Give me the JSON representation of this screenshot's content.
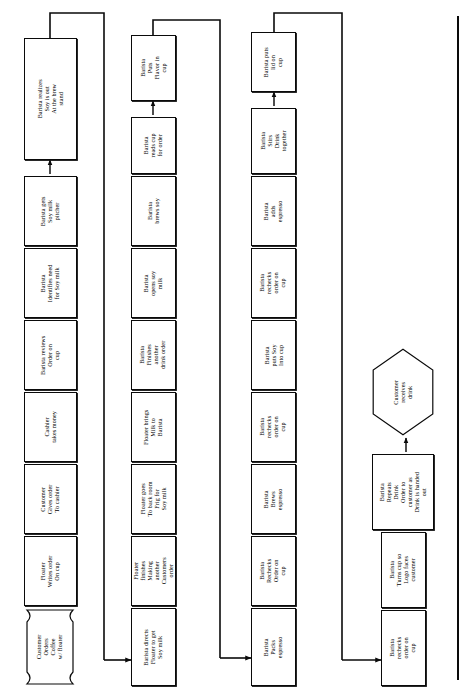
{
  "diagram": {
    "orientation": "rotated-90-ccw",
    "line_color": "#0a0a0a",
    "fill_color": "#ffffff",
    "rows": [
      {
        "id": "row-1",
        "nodes": [
          {
            "id": "n1",
            "shape": "banner",
            "lines": [
              "Customer",
              "Orders",
              "Coffee",
              "w/ floater"
            ]
          },
          {
            "id": "n2",
            "shape": "rect",
            "lines": [
              "Floater",
              "Writes order",
              "On cup"
            ]
          },
          {
            "id": "n3",
            "shape": "rect",
            "lines": [
              "Customer",
              "Gives order",
              "To cashier"
            ]
          },
          {
            "id": "n4",
            "shape": "rect",
            "lines": [
              "Cashier",
              "takes money"
            ]
          },
          {
            "id": "n5",
            "shape": "rect",
            "lines": [
              "Barista reviews",
              "Order on",
              "cup"
            ]
          },
          {
            "id": "n6",
            "shape": "rect",
            "lines": [
              "Barista",
              "Identifies need",
              "for Soy milk"
            ]
          },
          {
            "id": "n7",
            "shape": "rect",
            "lines": [
              "Barista gets",
              "Soy milk",
              "pitcher"
            ]
          },
          {
            "id": "n8",
            "shape": "rect",
            "lines": [
              "Barista realizes",
              "Soy is out",
              "At the brew",
              "stand"
            ]
          }
        ]
      },
      {
        "id": "row-2",
        "nodes": [
          {
            "id": "n9",
            "shape": "rect",
            "lines": [
              "Barista directs",
              "Floater to get",
              "Soy milk"
            ]
          },
          {
            "id": "n10",
            "shape": "rect",
            "lines": [
              "Floater",
              "finishes",
              "Making",
              "another",
              "Customers",
              "order"
            ]
          },
          {
            "id": "n11",
            "shape": "rect",
            "lines": [
              "Floater goes",
              "To back room",
              "Frig for",
              "Soy milk"
            ]
          },
          {
            "id": "n12",
            "shape": "rect",
            "lines": [
              "Floater brings",
              "Milk to",
              "Barista"
            ]
          },
          {
            "id": "n13",
            "shape": "rect",
            "lines": [
              "Barista",
              "Finishes",
              "another",
              "drink order"
            ]
          },
          {
            "id": "n14",
            "shape": "rect",
            "lines": [
              "Barista",
              "opens soy",
              "milk"
            ]
          },
          {
            "id": "n15",
            "shape": "rect",
            "lines": [
              "Barista",
              "brews soy"
            ]
          },
          {
            "id": "n16",
            "shape": "rect",
            "lines": [
              "Barista",
              "reads cup",
              "for order"
            ]
          },
          {
            "id": "n17",
            "shape": "rect",
            "lines": [
              "Barista",
              "Puts",
              "Flavor in",
              "cup"
            ]
          }
        ]
      },
      {
        "id": "row-3",
        "nodes": [
          {
            "id": "n18",
            "shape": "rect",
            "lines": [
              "Barista",
              "Packs",
              "espresso"
            ]
          },
          {
            "id": "n19",
            "shape": "rect",
            "lines": [
              "Barista",
              "Rechecks",
              "Order on",
              "cup"
            ]
          },
          {
            "id": "n20",
            "shape": "rect",
            "lines": [
              "Barista",
              "Brews",
              "espresso"
            ]
          },
          {
            "id": "n21",
            "shape": "rect",
            "lines": [
              "Barista",
              "rechecks",
              "order on",
              "cup"
            ]
          },
          {
            "id": "n22",
            "shape": "rect",
            "lines": [
              "Barista",
              "puts Soy",
              "Into cup"
            ]
          },
          {
            "id": "n23",
            "shape": "rect",
            "lines": [
              "Barista",
              "rechecks",
              "order on",
              "cup"
            ]
          },
          {
            "id": "n24",
            "shape": "rect",
            "lines": [
              "Barista",
              "adds",
              "espresso"
            ]
          },
          {
            "id": "n25",
            "shape": "rect",
            "lines": [
              "Barista",
              "Stirs",
              "Drink",
              "together"
            ]
          },
          {
            "id": "n26",
            "shape": "rect",
            "lines": [
              "Barista puts",
              "lid on",
              "cup"
            ]
          }
        ]
      },
      {
        "id": "row-4",
        "nodes": [
          {
            "id": "n27",
            "shape": "rect",
            "lines": [
              "Barista",
              "rechecks",
              "order on",
              "cup"
            ]
          },
          {
            "id": "n28",
            "shape": "rect",
            "lines": [
              "Barista",
              "Turns cup so",
              "Logo faces",
              "customer"
            ]
          },
          {
            "id": "n29",
            "shape": "rect",
            "lines": [
              "Barista",
              "Repeats",
              "Drink",
              "Order to",
              "customer as",
              "Drink is handed",
              "out"
            ]
          },
          {
            "id": "n30",
            "shape": "hex",
            "lines": [
              "Customer",
              "receives",
              "drink"
            ]
          }
        ]
      }
    ]
  }
}
